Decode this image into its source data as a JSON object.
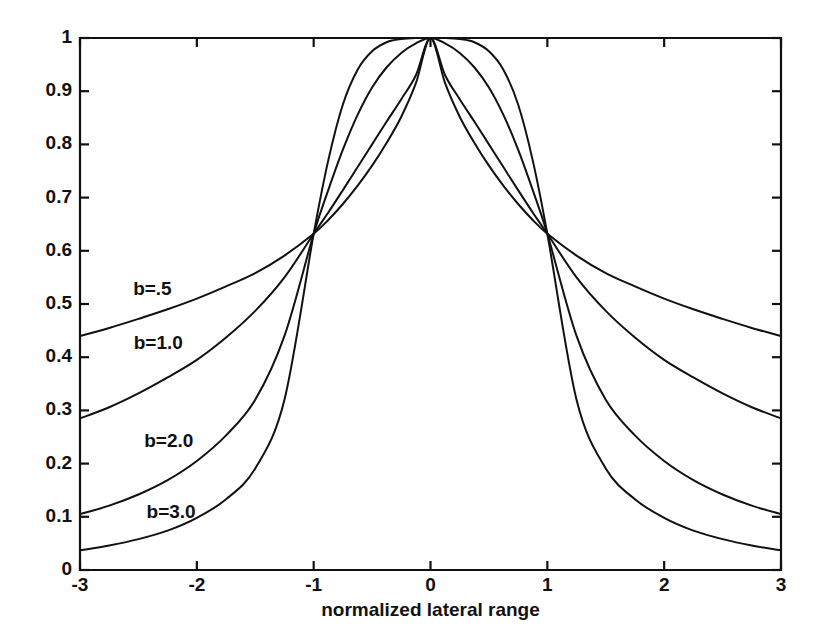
{
  "chart_data": {
    "type": "line",
    "title": "",
    "subtitle": "",
    "xlabel": "normalized lateral range",
    "ylabel": "",
    "xlim": [
      -3,
      3
    ],
    "ylim": [
      0,
      1
    ],
    "grid": false,
    "legend_position": "inline-annotations",
    "x_ticks": [
      "-3",
      "-2",
      "-1",
      "0",
      "1",
      "2",
      "3"
    ],
    "x_tick_values": [
      -3,
      -2,
      -1,
      0,
      1,
      2,
      3
    ],
    "y_ticks": [
      "0",
      "0.1",
      "0.2",
      "0.3",
      "0.4",
      "0.5",
      "0.6",
      "0.7",
      "0.8",
      "0.9",
      "1"
    ],
    "y_tick_values": [
      0,
      0.1,
      0.2,
      0.3,
      0.4,
      0.5,
      0.6,
      0.7,
      0.8,
      0.9,
      1
    ],
    "x": [
      -3,
      -2.75,
      -2.5,
      -2.25,
      -2,
      -1.75,
      -1.5,
      -1.25,
      -1,
      -0.875,
      -0.75,
      -0.625,
      -0.5,
      -0.375,
      -0.25,
      -0.125,
      0,
      0.125,
      0.25,
      0.375,
      0.5,
      0.625,
      0.75,
      0.875,
      1,
      1.25,
      1.5,
      1.75,
      2,
      2.25,
      2.5,
      2.75,
      3
    ],
    "series": [
      {
        "name": "b=.5",
        "label": "b=.5",
        "color": "#111111",
        "annotation_x": -2.38,
        "annotation_y": 0.527,
        "values": [
          0.44,
          0.455,
          0.472,
          0.49,
          0.51,
          0.533,
          0.558,
          0.591,
          0.632,
          0.658,
          0.688,
          0.722,
          0.76,
          0.803,
          0.852,
          0.915,
          1.0,
          0.915,
          0.852,
          0.803,
          0.76,
          0.722,
          0.688,
          0.658,
          0.632,
          0.591,
          0.558,
          0.533,
          0.51,
          0.49,
          0.472,
          0.455,
          0.44
        ]
      },
      {
        "name": "b=1.0",
        "label": "b=1.0",
        "color": "#111111",
        "annotation_x": -2.33,
        "annotation_y": 0.425,
        "values": [
          0.285,
          0.306,
          0.332,
          0.362,
          0.395,
          0.437,
          0.487,
          0.55,
          0.632,
          0.672,
          0.714,
          0.757,
          0.8,
          0.843,
          0.885,
          0.93,
          1.0,
          0.93,
          0.885,
          0.843,
          0.8,
          0.757,
          0.714,
          0.672,
          0.632,
          0.55,
          0.487,
          0.437,
          0.395,
          0.362,
          0.332,
          0.306,
          0.285
        ]
      },
      {
        "name": "b=2.0",
        "label": "b=2.0",
        "color": "#111111",
        "annotation_x": -2.24,
        "annotation_y": 0.24,
        "values": [
          0.105,
          0.121,
          0.142,
          0.169,
          0.205,
          0.253,
          0.32,
          0.44,
          0.632,
          0.714,
          0.79,
          0.855,
          0.907,
          0.945,
          0.972,
          0.99,
          1.0,
          0.99,
          0.972,
          0.945,
          0.907,
          0.855,
          0.79,
          0.714,
          0.632,
          0.44,
          0.32,
          0.253,
          0.205,
          0.169,
          0.142,
          0.121,
          0.105
        ]
      },
      {
        "name": "b=3.0",
        "label": "b=3.0",
        "color": "#111111",
        "annotation_x": -2.22,
        "annotation_y": 0.108,
        "values": [
          0.037,
          0.046,
          0.058,
          0.074,
          0.098,
          0.133,
          0.191,
          0.32,
          0.632,
          0.77,
          0.875,
          0.94,
          0.975,
          0.992,
          0.998,
          1.0,
          1.0,
          1.0,
          0.998,
          0.992,
          0.975,
          0.94,
          0.875,
          0.77,
          0.632,
          0.32,
          0.191,
          0.133,
          0.098,
          0.074,
          0.058,
          0.046,
          0.037
        ]
      }
    ],
    "annotations": [
      {
        "text": "b=.5",
        "x": -2.38,
        "y": 0.527
      },
      {
        "text": "b=1.0",
        "x": -2.33,
        "y": 0.425
      },
      {
        "text": "b=2.0",
        "x": -2.24,
        "y": 0.24
      },
      {
        "text": "b=3.0",
        "x": -2.22,
        "y": 0.108
      }
    ],
    "colors": {
      "axis": "#111111",
      "curve": "#111111",
      "background": "#ffffff",
      "text": "#111111"
    }
  }
}
